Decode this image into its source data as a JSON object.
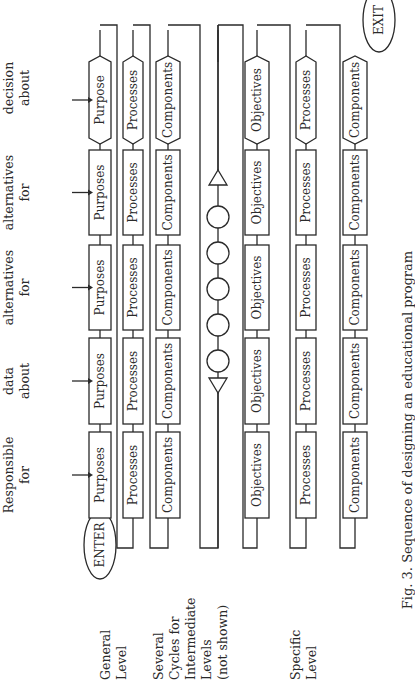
{
  "figure": {
    "caption": "Fig. 3. Sequence of designing an educational program",
    "enter_label": "ENTER",
    "exit_label": "EXIT"
  },
  "steps": [
    {
      "action": [
        "Identify",
        "Persons",
        "Responsible",
        "for"
      ]
    },
    {
      "action": [
        "Collect",
        "data",
        "about"
      ]
    },
    {
      "action": [
        "Identify",
        "several",
        "alternatives",
        "for"
      ]
    },
    {
      "action": [
        "Refine two",
        "or more",
        "alternatives",
        "for"
      ]
    },
    {
      "action": [
        "Make a",
        "decision",
        "about"
      ]
    }
  ],
  "levels": [
    {
      "name": "general",
      "label": [
        "General",
        "Level"
      ]
    },
    {
      "name": "intermediate",
      "label": [
        "Several",
        "Cycles for",
        "Intermediate",
        "Levels",
        "(not shown)"
      ]
    },
    {
      "name": "specific",
      "label": [
        "Specific",
        "Level"
      ]
    }
  ],
  "rows": {
    "general_purposes": [
      "Purposes",
      "Purposes",
      "Purposes",
      "Purposes",
      "Purpose"
    ],
    "general_processes": [
      "Processes",
      "Processes",
      "Processes",
      "Processes",
      "Processes"
    ],
    "general_components": [
      "Components",
      "Components",
      "Components",
      "Components",
      "Components"
    ],
    "specific_objectives": [
      "Objectives",
      "Objectives",
      "Objectives",
      "Objectives",
      "Objectives"
    ],
    "specific_processes": [
      "Processes",
      "Processes",
      "Processes",
      "Processes",
      "Processes"
    ],
    "specific_components": [
      "Components",
      "Components",
      "Components",
      "Components",
      "Components"
    ]
  },
  "intermediate_symbols": {
    "start": "triangle",
    "cycles": 5,
    "end": "triangle"
  }
}
